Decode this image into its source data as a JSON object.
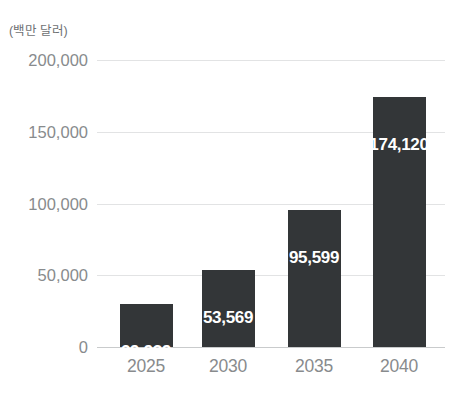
{
  "chart_data": {
    "type": "bar",
    "title": "",
    "subtitle": "",
    "unit_caption": "(백만 달러)",
    "xlabel": "",
    "ylabel": "",
    "categories": [
      "2025",
      "2030",
      "2035",
      "2040"
    ],
    "values": [
      29939,
      53569,
      95599,
      174120
    ],
    "value_labels": [
      "29,939",
      "53,569",
      "95,599",
      "174,120"
    ],
    "ytick_values": [
      0,
      50000,
      100000,
      150000,
      200000
    ],
    "ytick_labels": [
      "0",
      "50,000",
      "100,000",
      "150,000",
      "200,000"
    ],
    "ylim": [
      0,
      200000
    ],
    "grid": true,
    "grid_axis": "y",
    "legend": false,
    "legend_position": "none",
    "series": [
      {
        "name": "",
        "values": [
          29939,
          53569,
          95599,
          174120
        ]
      }
    ],
    "colors": {
      "bar": "#333638",
      "value_label": "#ffffff",
      "tick_label": "#888b8d",
      "caption": "#6e7173",
      "gridline": "#e2e3e4",
      "baseline": "#c9cbcc",
      "background": "#ffffff"
    }
  }
}
